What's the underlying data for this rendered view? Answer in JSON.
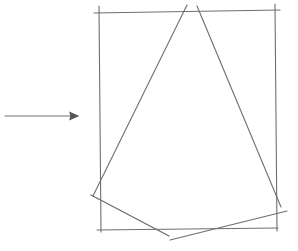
{
  "figure": {
    "style": "hand-drawn pencil sketch",
    "stroke_color": "#6e6e6e",
    "background": "#ffffff",
    "elements": [
      {
        "type": "arrow",
        "from": [
          5,
          116
        ],
        "to": [
          78,
          116
        ],
        "direction": "right"
      },
      {
        "type": "rectangle",
        "corners": [
          [
            99,
            12
          ],
          [
            277,
            10
          ],
          [
            277,
            230
          ],
          [
            99,
            230
          ]
        ]
      },
      {
        "type": "line",
        "from": [
          187,
          5
        ],
        "to": [
          95,
          196
        ]
      },
      {
        "type": "line",
        "from": [
          197,
          5
        ],
        "to": [
          282,
          208
        ]
      },
      {
        "type": "line",
        "from": [
          92,
          195
        ],
        "to": [
          169,
          236
        ]
      },
      {
        "type": "line",
        "from": [
          170,
          240
        ],
        "to": [
          287,
          211
        ]
      }
    ]
  },
  "caption": {
    "text": "",
    "note": "caption text cut off at bottom edge"
  }
}
